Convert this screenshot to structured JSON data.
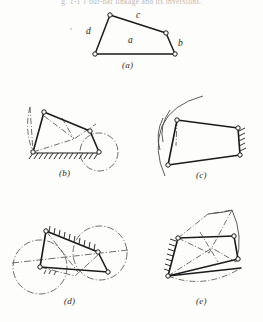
{
  "page": {
    "top_text": "g. 1-1 1 our-bar  linkage and its inversions.",
    "background_color": "#fdfdfb",
    "ink_color": "#1b1b1b"
  },
  "figures": [
    {
      "id": "a",
      "caption": "(a)",
      "description": "four-bar linkage quadrilateral with link labels",
      "link_labels": [
        {
          "name": "a",
          "text": "a",
          "x": 130,
          "y": 41
        },
        {
          "name": "b",
          "text": "b",
          "x": 177,
          "y": 44
        },
        {
          "name": "c",
          "text": "c",
          "x": 137,
          "y": 16
        },
        {
          "name": "d",
          "text": "d",
          "x": 88,
          "y": 31
        }
      ],
      "joints": [
        {
          "x": 110,
          "y": 15
        },
        {
          "x": 166,
          "y": 33
        },
        {
          "x": 175,
          "y": 54
        },
        {
          "x": 95,
          "y": 54
        }
      ],
      "caption_pos": {
        "x": 122,
        "y": 60
      }
    },
    {
      "id": "b",
      "caption": "(b)",
      "description": "crank-rocker inversion, fixed ground link with hatching, crank circle at right",
      "caption_pos": {
        "x": 62,
        "y": 172
      }
    },
    {
      "id": "c",
      "caption": "(c)",
      "description": "inversion with vertical hatched ground link at right and rocker arcs at left",
      "caption_pos": {
        "x": 196,
        "y": 172
      }
    },
    {
      "id": "d",
      "caption": "(d)",
      "description": "double-crank inversion with hatched coupler and two circular paths",
      "caption_pos": {
        "x": 66,
        "y": 300
      }
    },
    {
      "id": "e",
      "caption": "(e)",
      "description": "double-rocker inversion with hatched link at left and dash-dot coupler curves",
      "caption_pos": {
        "x": 196,
        "y": 300
      }
    }
  ],
  "colors": {
    "ink": "#1b1b1b",
    "light_ink": "#555555",
    "paper": "#fdfdfb",
    "faded": "#b9b9b6"
  }
}
